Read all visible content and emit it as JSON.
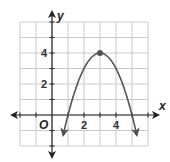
{
  "chart_data": {
    "type": "line",
    "title": "",
    "xlabel": "x",
    "ylabel": "y",
    "origin_label": "O",
    "x_ticks": [
      {
        "value": 2,
        "label": "2"
      },
      {
        "value": 4,
        "label": "4"
      }
    ],
    "y_ticks": [
      {
        "value": 2,
        "label": "2"
      },
      {
        "value": 4,
        "label": "4"
      }
    ],
    "xlim": [
      -2,
      6
    ],
    "ylim": [
      -2,
      6
    ],
    "grid": true,
    "legend": null,
    "series": [
      {
        "name": "parabola",
        "equation": "y = -(x - 3)^2 + 4",
        "vertex": {
          "x": 3,
          "y": 4
        },
        "x_intercepts": [
          1,
          5
        ],
        "x": [
          0.75,
          1,
          1.5,
          2,
          2.5,
          3,
          3.5,
          4,
          4.5,
          5,
          5.25
        ],
        "y": [
          -1.06,
          0,
          1.75,
          3,
          3.75,
          4,
          3.75,
          3,
          1.75,
          0,
          -1.06
        ],
        "arrows_both_ends": true
      }
    ],
    "colors": {
      "curve": "#555555",
      "grid": "#c8c8c8",
      "axis": "#222222",
      "vertex_point": "#555555"
    }
  }
}
